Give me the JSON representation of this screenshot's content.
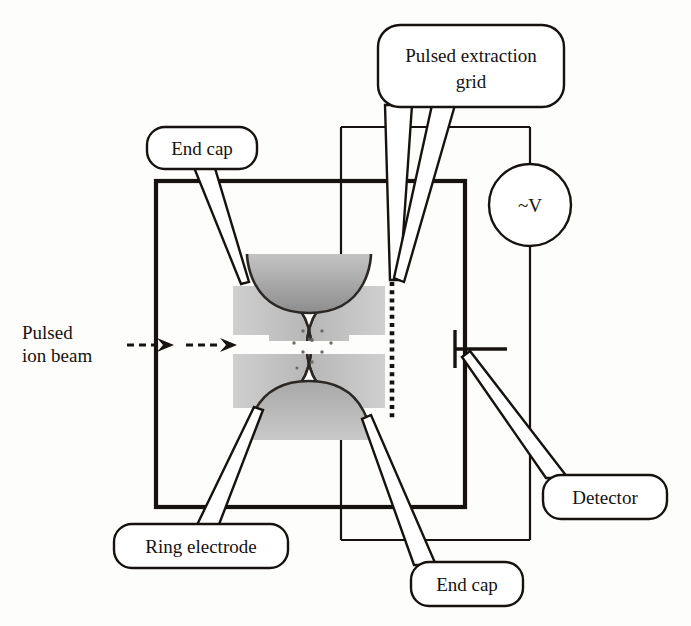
{
  "figure": {
    "kind": "ion-trap-schematic",
    "title_visible": false
  },
  "labels": {
    "pulsed_extraction_grid": "Pulsed extraction\ngrid",
    "pulsed_extraction_grid_line1": "Pulsed extraction",
    "pulsed_extraction_grid_line2": "grid",
    "end_cap_top": "End cap",
    "end_cap_bottom": "End cap",
    "ring_electrode": "Ring electrode",
    "detector": "Detector",
    "pulsed_ion_beam_line1": "Pulsed",
    "pulsed_ion_beam_line2": "ion beam",
    "voltage_source": "~V"
  },
  "components": {
    "vacuum_chamber": "vacuum-chamber-outline",
    "extraction_grid": "dotted-grid-line",
    "detector_plate": "detector-plate",
    "ac_source": "ac-voltage-source",
    "ion_cloud": "trapped-ion-cloud",
    "ring_electrode_shape": "hyperbolic-ring-electrode",
    "end_cap_shape": "hyperbolic-end-cap",
    "beam_arrows": "dashed-ion-beam-arrows"
  },
  "colors": {
    "ink": "#16120f",
    "electrode_light_gray": "#c8c8c8",
    "electrode_mid_gray": "#b4b4b4",
    "end_cap_dark_gray": "#9a9a9a",
    "background": "#fdfdfc",
    "ion_dot": "#6e6a66"
  },
  "counts": {
    "beam_arrows": 2,
    "ion_dots": 9,
    "end_caps": 2
  }
}
